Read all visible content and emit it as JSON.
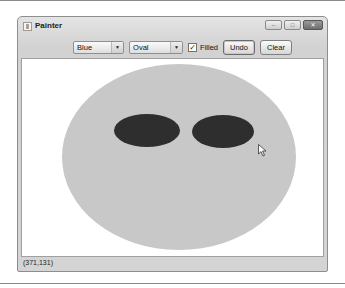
{
  "window": {
    "title": "Painter",
    "controls": {
      "minimize": "–",
      "maximize": "□",
      "close": "✕"
    }
  },
  "toolbar": {
    "color_select": {
      "value": "Blue",
      "arrow": "▼"
    },
    "shape_select": {
      "value": "Oval",
      "arrow": "▼"
    },
    "filled": {
      "label": "Filled",
      "checked": true,
      "mark": "✓"
    },
    "undo_label": "Undo",
    "clear_label": "Clear"
  },
  "canvas": {
    "shapes": [
      {
        "type": "oval",
        "filled": true,
        "color": "#c8c8c8",
        "role": "face"
      },
      {
        "type": "oval",
        "filled": true,
        "color": "#2e2e2e",
        "role": "left-eye"
      },
      {
        "type": "oval",
        "filled": true,
        "color": "#2e2e2e",
        "role": "right-eye"
      }
    ]
  },
  "statusbar": {
    "coordinates": "(371,131)"
  }
}
